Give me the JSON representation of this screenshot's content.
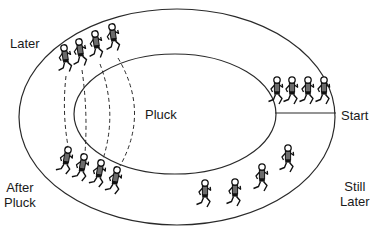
{
  "diagram": {
    "colors": {
      "line": "#2a2a2a",
      "runner": "#111111",
      "shirt": "#6b6b6b",
      "shorts": "#111111",
      "background": "#ffffff"
    },
    "track": {
      "outer": {
        "cx": 177,
        "cy": 117,
        "rx": 158,
        "ry": 108
      },
      "inner": {
        "cx": 175,
        "cy": 114,
        "rx": 101,
        "ry": 60
      },
      "start_line": {
        "x1": 275,
        "y1": 113,
        "x2": 336,
        "y2": 113
      }
    },
    "labels": [
      {
        "id": "later",
        "text": "Later",
        "x": 10,
        "y": 36
      },
      {
        "id": "pluck",
        "text": "Pluck",
        "x": 145,
        "y": 107
      },
      {
        "id": "start",
        "text": "Start",
        "x": 341,
        "y": 108
      },
      {
        "id": "after-pluck",
        "text": "After\nPluck",
        "x": 4,
        "y": 180
      },
      {
        "id": "still-later",
        "text": "Still\nLater",
        "x": 340,
        "y": 179
      }
    ],
    "groups": [
      {
        "id": "start",
        "name": "Start",
        "runners": [
          {
            "x": 277,
            "y": 80,
            "angle": 0
          },
          {
            "x": 292,
            "y": 80,
            "angle": 0
          },
          {
            "x": 308,
            "y": 80,
            "angle": 0
          },
          {
            "x": 324,
            "y": 80,
            "angle": 0
          }
        ]
      },
      {
        "id": "later",
        "name": "Later",
        "runners": [
          {
            "x": 64,
            "y": 48,
            "angle": -8
          },
          {
            "x": 79,
            "y": 42,
            "angle": -8
          },
          {
            "x": 95,
            "y": 34,
            "angle": -8
          },
          {
            "x": 112,
            "y": 27,
            "angle": -8
          }
        ]
      },
      {
        "id": "after-pluck",
        "name": "After Pluck",
        "runners": [
          {
            "x": 68,
            "y": 150,
            "angle": 10
          },
          {
            "x": 84,
            "y": 157,
            "angle": 10
          },
          {
            "x": 101,
            "y": 163,
            "angle": 10
          },
          {
            "x": 117,
            "y": 170,
            "angle": 10
          }
        ]
      },
      {
        "id": "still-later",
        "name": "Still Later",
        "runners": [
          {
            "x": 205,
            "y": 183,
            "angle": 0
          },
          {
            "x": 235,
            "y": 182,
            "angle": 0
          },
          {
            "x": 262,
            "y": 167,
            "angle": 0
          },
          {
            "x": 288,
            "y": 148,
            "angle": 0
          }
        ]
      }
    ],
    "dashed_paths": [
      {
        "from": [
          66,
          76
        ],
        "ctrl": [
          62,
          112
        ],
        "to": [
          68,
          146
        ]
      },
      {
        "from": [
          82,
          70
        ],
        "ctrl": [
          88,
          112
        ],
        "to": [
          85,
          153
        ]
      },
      {
        "from": [
          100,
          64
        ],
        "ctrl": [
          118,
          112
        ],
        "to": [
          103,
          159
        ]
      },
      {
        "from": [
          118,
          58
        ],
        "ctrl": [
          150,
          112
        ],
        "to": [
          120,
          166
        ]
      }
    ]
  }
}
